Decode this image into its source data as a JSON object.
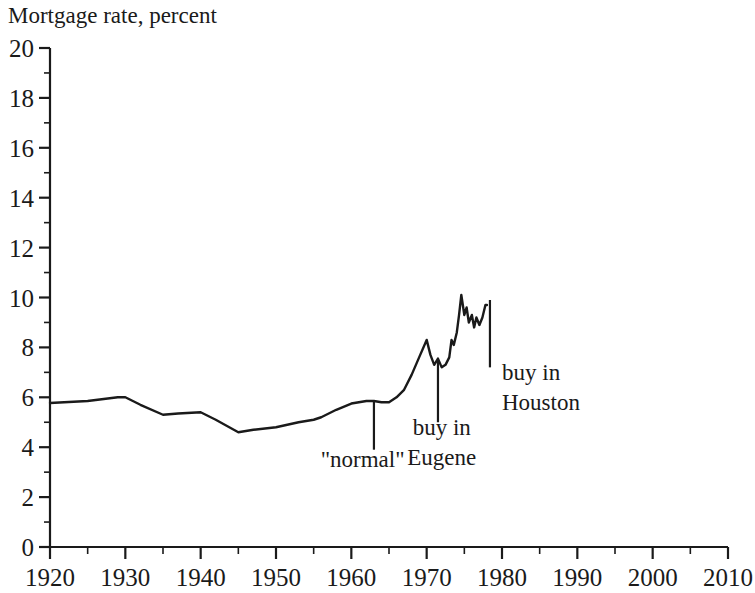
{
  "chart_data": {
    "type": "line",
    "title": "Mortgage rate, percent",
    "xlabel": "",
    "ylabel": "Mortgage rate, percent",
    "xlim": [
      1920,
      2010
    ],
    "ylim": [
      0,
      20
    ],
    "grid": false,
    "legend": "none",
    "x_ticks": [
      "1920",
      "1930",
      "1940",
      "1950",
      "1960",
      "1970",
      "1980",
      "1990",
      "2000",
      "2010"
    ],
    "x_tick_values": [
      1920,
      1930,
      1940,
      1950,
      1960,
      1970,
      1980,
      1990,
      2000,
      2010
    ],
    "x_minor_step": 5,
    "y_ticks": [
      "0",
      "2",
      "4",
      "6",
      "8",
      "10",
      "12",
      "14",
      "16",
      "18",
      "20"
    ],
    "y_tick_values": [
      0,
      2,
      4,
      6,
      8,
      10,
      12,
      14,
      16,
      18,
      20
    ],
    "y_minor_step": 1,
    "series": [
      {
        "name": "Mortgage rate",
        "color": "#1a1a1a",
        "x": [
          1920,
          1925,
          1929,
          1930,
          1932,
          1935,
          1937,
          1940,
          1942,
          1945,
          1947,
          1950,
          1953,
          1955,
          1956,
          1958,
          1960,
          1962,
          1963,
          1964,
          1965,
          1966,
          1967,
          1968,
          1969,
          1970,
          1970.5,
          1971,
          1971.5,
          1972,
          1972.5,
          1973,
          1973.3,
          1973.6,
          1974,
          1974.3,
          1974.6,
          1975,
          1975.3,
          1975.6,
          1976,
          1976.3,
          1976.6,
          1977,
          1977.4,
          1977.8,
          1978
        ],
        "y": [
          5.77,
          5.85,
          6.0,
          6.0,
          5.7,
          5.3,
          5.35,
          5.4,
          5.1,
          4.6,
          4.7,
          4.8,
          5.0,
          5.1,
          5.2,
          5.5,
          5.75,
          5.85,
          5.85,
          5.8,
          5.8,
          6.0,
          6.3,
          6.9,
          7.6,
          8.3,
          7.7,
          7.3,
          7.55,
          7.2,
          7.3,
          7.6,
          8.3,
          8.1,
          8.6,
          9.3,
          10.1,
          9.3,
          9.6,
          9.0,
          9.3,
          8.8,
          9.2,
          8.9,
          9.2,
          9.7,
          9.7
        ]
      }
    ],
    "annotations": [
      {
        "id": "normal",
        "label": "\"normal\"",
        "x": 1963,
        "y_top": 5.85,
        "y_bottom": 3.9,
        "label_x": 1961.5,
        "label_y": 3.2,
        "anchor": "middle",
        "lines": [
          "\"normal\""
        ]
      },
      {
        "id": "buy-in-eugene",
        "label": "buy in Eugene",
        "x": 1971.5,
        "y_top": 7.45,
        "y_bottom": 5.0,
        "label_x": 1972.0,
        "label_y": 4.5,
        "anchor": "middle",
        "lines": [
          "buy in",
          "Eugene"
        ]
      },
      {
        "id": "buy-in-houston",
        "label": "buy in Houston",
        "x": 1978.4,
        "y_top": 9.9,
        "y_bottom": 7.2,
        "label_x": 1980.0,
        "label_y": 6.7,
        "anchor": "start",
        "lines": [
          "buy in",
          "Houston"
        ]
      }
    ]
  },
  "colors": {
    "axis": "#1a1a1a",
    "line": "#1a1a1a",
    "background": "#ffffff",
    "text": "#1a1a1a"
  }
}
